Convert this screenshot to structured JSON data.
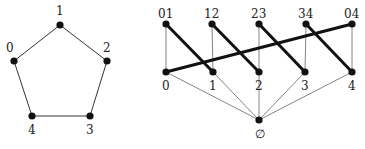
{
  "pentagon": {
    "nodes": [
      {
        "id": "0",
        "label": "0",
        "x": 14,
        "y": 61,
        "lx": 6,
        "ly": 52
      },
      {
        "id": "1",
        "label": "1",
        "x": 60,
        "y": 25,
        "lx": 56,
        "ly": 15
      },
      {
        "id": "2",
        "label": "2",
        "x": 107,
        "y": 61,
        "lx": 103,
        "ly": 52
      },
      {
        "id": "3",
        "label": "3",
        "x": 90,
        "y": 116,
        "lx": 86,
        "ly": 134
      },
      {
        "id": "4",
        "label": "4",
        "x": 32,
        "y": 116,
        "lx": 28,
        "ly": 134
      }
    ],
    "edges": [
      [
        "0",
        "1"
      ],
      [
        "1",
        "2"
      ],
      [
        "2",
        "3"
      ],
      [
        "3",
        "4"
      ],
      [
        "4",
        "0"
      ]
    ]
  },
  "lattice": {
    "nodes": [
      {
        "id": "01",
        "label": "01",
        "x": 166,
        "y": 24,
        "lx": 158,
        "ly": 18
      },
      {
        "id": "12",
        "label": "12",
        "x": 212,
        "y": 24,
        "lx": 204,
        "ly": 18
      },
      {
        "id": "23",
        "label": "23",
        "x": 259,
        "y": 24,
        "lx": 251,
        "ly": 18
      },
      {
        "id": "34",
        "label": "34",
        "x": 306,
        "y": 24,
        "lx": 298,
        "ly": 18
      },
      {
        "id": "04",
        "label": "04",
        "x": 352,
        "y": 24,
        "lx": 344,
        "ly": 18
      },
      {
        "id": "0",
        "label": "0",
        "x": 166,
        "y": 72,
        "lx": 162,
        "ly": 90
      },
      {
        "id": "1",
        "label": "1",
        "x": 213,
        "y": 72,
        "lx": 209,
        "ly": 90
      },
      {
        "id": "2",
        "label": "2",
        "x": 259,
        "y": 72,
        "lx": 255,
        "ly": 90
      },
      {
        "id": "3",
        "label": "3",
        "x": 305,
        "y": 72,
        "lx": 301,
        "ly": 90
      },
      {
        "id": "4",
        "label": "4",
        "x": 352,
        "y": 72,
        "lx": 348,
        "ly": 90
      },
      {
        "id": "empty",
        "label": "∅",
        "x": 259,
        "y": 120,
        "lx": 255,
        "ly": 138
      }
    ],
    "thin_edges": [
      [
        "01",
        "0"
      ],
      [
        "12",
        "1"
      ],
      [
        "23",
        "2"
      ],
      [
        "34",
        "3"
      ],
      [
        "04",
        "4"
      ],
      [
        "0",
        "empty"
      ],
      [
        "1",
        "empty"
      ],
      [
        "2",
        "empty"
      ],
      [
        "3",
        "empty"
      ],
      [
        "4",
        "empty"
      ]
    ],
    "thick_edges": [
      [
        "01",
        "1"
      ],
      [
        "12",
        "2"
      ],
      [
        "23",
        "3"
      ],
      [
        "34",
        "4"
      ],
      [
        "04",
        "0"
      ]
    ]
  },
  "colors": {
    "node": "#111111",
    "thin_edge": "#777777",
    "thick_edge": "#111111"
  }
}
